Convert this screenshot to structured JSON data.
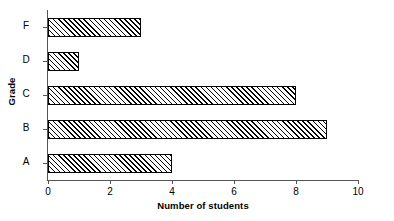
{
  "chart_data": {
    "type": "bar",
    "orientation": "horizontal",
    "title": "",
    "xlabel": "Number of students",
    "ylabel": "Grade",
    "categories": [
      "F",
      "D",
      "C",
      "B",
      "A"
    ],
    "values": [
      3,
      1,
      8,
      9,
      4
    ],
    "xlim": [
      0,
      10
    ],
    "xticks": [
      0,
      2,
      4,
      6,
      8,
      10
    ],
    "xtick_labels": [
      "0",
      "2",
      "4",
      "6",
      "8",
      "10"
    ],
    "grid": false,
    "legend": false,
    "legend_position": "none",
    "bar_fill": "#ffffff",
    "bar_hatch": "diagonal",
    "bar_edge_color": "#000000",
    "axis_color": "#555555",
    "background": "#ffffff"
  }
}
